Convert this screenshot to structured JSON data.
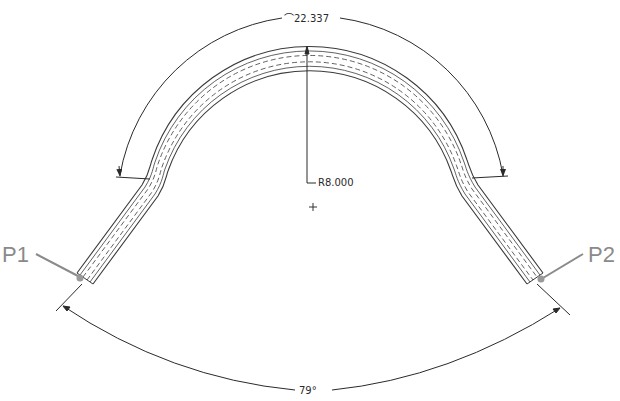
{
  "drawing": {
    "type": "bent-tube-detail",
    "colors": {
      "background": "#ffffff",
      "linework": "#3a3a3a",
      "dimension": "#2a2a2a",
      "callout": "#8a8a8a"
    },
    "center_mark": "+",
    "dimensions": {
      "arc_length": {
        "symbol": "⌒",
        "value": "22.337",
        "label": "⌒22.337"
      },
      "radius": {
        "value": "8.000",
        "label": "R8.000"
      },
      "angle": {
        "value": "79",
        "label": "79°"
      }
    },
    "points": [
      {
        "id": "P1",
        "label": "P1"
      },
      {
        "id": "P2",
        "label": "P2"
      }
    ]
  }
}
